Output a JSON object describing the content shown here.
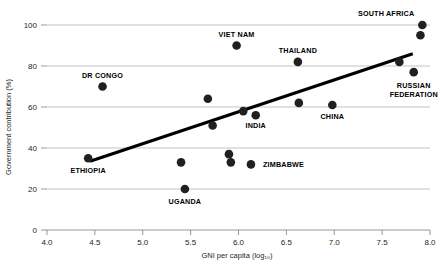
{
  "chart_data": {
    "type": "scatter",
    "title": "",
    "xlabel": "GNI per capita (log₁₀)",
    "ylabel": "Government contribution (%)",
    "xlim": [
      4.0,
      8.0
    ],
    "ylim": [
      0,
      100
    ],
    "xticks": [
      "4.0",
      "4.5",
      "5.0",
      "5.5",
      "6.0",
      "6.5",
      "7.0",
      "7.5",
      "8.0"
    ],
    "xtick_values": [
      4.0,
      4.5,
      5.0,
      5.5,
      6.0,
      6.5,
      7.0,
      7.5,
      8.0
    ],
    "yticks": [
      "0",
      "20",
      "40",
      "60",
      "80",
      "100"
    ],
    "ytick_values": [
      0,
      20,
      40,
      60,
      80,
      100
    ],
    "grid": "horizontal",
    "legend": "none",
    "marker_color": "#231f20",
    "trendline": {
      "color": "#000000",
      "x_start": 4.45,
      "y_start": 33.5,
      "x_end": 7.82,
      "y_end": 86.0
    },
    "points": [
      {
        "label": "ETHIOPIA",
        "x": 4.43,
        "y": 35,
        "label_dx": 0,
        "label_dy": 15,
        "anchor": "middle"
      },
      {
        "label": "DR CONGO",
        "x": 4.58,
        "y": 70,
        "label_dx": 0,
        "label_dy": -9,
        "anchor": "middle"
      },
      {
        "label": "",
        "x": 5.4,
        "y": 33,
        "label_dx": 0,
        "label_dy": 0,
        "anchor": "middle"
      },
      {
        "label": "UGANDA",
        "x": 5.44,
        "y": 20,
        "label_dx": 0,
        "label_dy": 15,
        "anchor": "middle"
      },
      {
        "label": "",
        "x": 5.68,
        "y": 64,
        "label_dx": 0,
        "label_dy": 0,
        "anchor": "middle"
      },
      {
        "label": "",
        "x": 5.73,
        "y": 51,
        "label_dx": 0,
        "label_dy": 0,
        "anchor": "middle"
      },
      {
        "label": "",
        "x": 5.9,
        "y": 37,
        "label_dx": 0,
        "label_dy": 0,
        "anchor": "middle"
      },
      {
        "label": "",
        "x": 5.92,
        "y": 33,
        "label_dx": 0,
        "label_dy": 0,
        "anchor": "middle"
      },
      {
        "label": "VIET NAM",
        "x": 5.98,
        "y": 90,
        "label_dx": 0,
        "label_dy": -9,
        "anchor": "middle"
      },
      {
        "label": "",
        "x": 6.05,
        "y": 58,
        "label_dx": 0,
        "label_dy": 0,
        "anchor": "middle"
      },
      {
        "label": "INDIA",
        "x": 6.18,
        "y": 56,
        "label_dx": 0,
        "label_dy": 13,
        "anchor": "middle"
      },
      {
        "label": "ZIMBABWE",
        "x": 6.13,
        "y": 32,
        "label_dx": 12,
        "label_dy": 3,
        "anchor": "start"
      },
      {
        "label": "THAILAND",
        "x": 6.62,
        "y": 82,
        "label_dx": 0,
        "label_dy": -9,
        "anchor": "middle"
      },
      {
        "label": "",
        "x": 6.63,
        "y": 62,
        "label_dx": 0,
        "label_dy": 0,
        "anchor": "middle"
      },
      {
        "label": "CHINA",
        "x": 6.98,
        "y": 61,
        "label_dx": 0,
        "label_dy": 14,
        "anchor": "middle"
      },
      {
        "label": "",
        "x": 7.68,
        "y": 82,
        "label_dx": 0,
        "label_dy": 0,
        "anchor": "middle"
      },
      {
        "label": "RUSSIAN FEDERATION",
        "x": 7.83,
        "y": 77,
        "label_dx": 0,
        "label_dy": 16,
        "anchor": "middle"
      },
      {
        "label": "",
        "x": 7.9,
        "y": 95,
        "label_dx": 0,
        "label_dy": 0,
        "anchor": "middle"
      },
      {
        "label": "SOUTH AFRICA",
        "x": 7.92,
        "y": 100,
        "label_dx": -8,
        "label_dy": -9,
        "anchor": "end"
      }
    ],
    "multiline_labels": {
      "RUSSIAN FEDERATION": [
        "RUSSIAN",
        "FEDERATION"
      ]
    }
  }
}
